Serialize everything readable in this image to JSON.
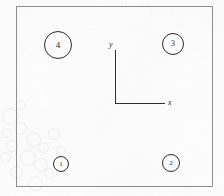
{
  "figure": {
    "type": "technical-line-drawing",
    "background_color": "#fdfdfd",
    "line_color": "#2c2c2e",
    "frame_color": "#8e8e90"
  },
  "frame": {
    "name": "outer-rectangle",
    "left": 16,
    "top": 6,
    "width": 197,
    "height": 181
  },
  "axes": {
    "origin": {
      "x": 115,
      "y": 103
    },
    "y_label": "y",
    "x_label": "x",
    "y_axis_length": 53,
    "x_axis_length": 50,
    "color": "#2f2f31"
  },
  "callouts": [
    {
      "label": "4",
      "cx": 58,
      "cy": 45,
      "r": 14,
      "font_size": 9
    },
    {
      "label": "3",
      "cx": 173,
      "cy": 44,
      "r": 11,
      "font_size": 8
    },
    {
      "label": "1",
      "cx": 61,
      "cy": 164,
      "r": 8,
      "font_size": 7
    },
    {
      "label": "2",
      "cx": 171,
      "cy": 163,
      "r": 9,
      "font_size": 7
    }
  ],
  "scan_artifacts": {
    "ghost_texts": [
      {
        "text": "1111111",
        "left": 120,
        "top": 2,
        "size": 7,
        "opacity": 0.5
      },
      {
        "text": "111 1 1",
        "left": 150,
        "top": 10,
        "size": 6,
        "opacity": 0.4
      },
      {
        "text": "11 1",
        "left": 175,
        "top": 22,
        "size": 6,
        "opacity": 0.35
      },
      {
        "text": "1 11",
        "left": 60,
        "top": 52,
        "size": 6,
        "opacity": 0.3
      },
      {
        "text": "11",
        "left": 20,
        "top": 46,
        "size": 6,
        "opacity": 0.3
      }
    ],
    "ghost_circles": [
      {
        "left": 2,
        "top": 108,
        "size": 15
      },
      {
        "left": 14,
        "top": 122,
        "size": 11
      },
      {
        "left": 26,
        "top": 132,
        "size": 13
      },
      {
        "left": 6,
        "top": 140,
        "size": 10
      },
      {
        "left": 20,
        "top": 150,
        "size": 14
      },
      {
        "left": 38,
        "top": 142,
        "size": 9
      },
      {
        "left": 34,
        "top": 158,
        "size": 12
      },
      {
        "left": 48,
        "top": 128,
        "size": 10
      },
      {
        "left": 10,
        "top": 166,
        "size": 11
      },
      {
        "left": 28,
        "top": 176,
        "size": 13
      },
      {
        "left": 2,
        "top": 128,
        "size": 8
      },
      {
        "left": 44,
        "top": 168,
        "size": 9
      },
      {
        "left": 56,
        "top": 146,
        "size": 8
      },
      {
        "left": 0,
        "top": 152,
        "size": 9
      },
      {
        "left": 16,
        "top": 100,
        "size": 8
      }
    ]
  }
}
